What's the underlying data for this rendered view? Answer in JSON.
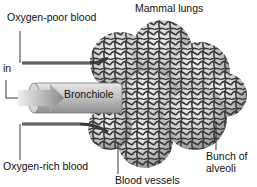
{
  "diagram": {
    "title": "Mammal lungs",
    "labels": {
      "oxygen_poor": "Oxygen-poor blood",
      "in": "in",
      "bronchiole": "Bronchiole",
      "oxygen_rich": "Oxygen-rich blood",
      "blood_vessels": "Blood vessels",
      "bunch_line1": "Bunch of",
      "bunch_line2": "alveoli"
    },
    "colors": {
      "mesh": "#3a3a3a",
      "alveolus_fill": "#c9c9c9",
      "alveolus_light": "#f2f2f2",
      "tube": "#bdbdbd",
      "arrow": "#8a8a8a",
      "text": "#111111"
    }
  }
}
